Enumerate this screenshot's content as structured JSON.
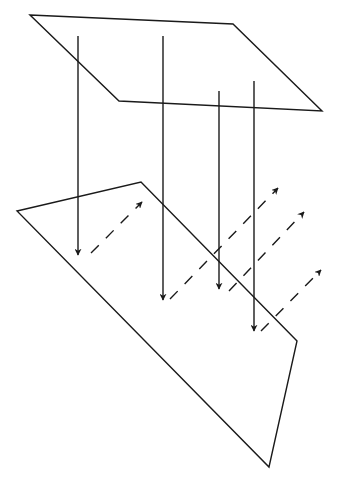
{
  "diagram": {
    "type": "reflection-geometry",
    "top_plane": {
      "points": [
        [
          30,
          15
        ],
        [
          233,
          24
        ],
        [
          322,
          111
        ],
        [
          119,
          101
        ]
      ]
    },
    "bottom_plane": {
      "points": [
        [
          17,
          211
        ],
        [
          141,
          182
        ],
        [
          297,
          341
        ],
        [
          269,
          467
        ]
      ]
    },
    "incident_rays": [
      {
        "x1": 78,
        "y1": 36,
        "x2": 78,
        "y2": 255
      },
      {
        "x1": 163,
        "y1": 36,
        "x2": 163,
        "y2": 300
      },
      {
        "x1": 219,
        "y1": 91,
        "x2": 219,
        "y2": 289
      },
      {
        "x1": 254,
        "y1": 81,
        "x2": 254,
        "y2": 331
      }
    ],
    "reflected_rays": [
      {
        "x1": 91,
        "y1": 253,
        "x2": 142,
        "y2": 202
      },
      {
        "x1": 170,
        "y1": 299,
        "x2": 278,
        "y2": 188
      },
      {
        "x1": 229,
        "y1": 291,
        "x2": 304,
        "y2": 212
      },
      {
        "x1": 261,
        "y1": 331,
        "x2": 321,
        "y2": 270
      }
    ],
    "colors": {
      "stroke": "#1a1a1a",
      "background": "#ffffff"
    }
  }
}
